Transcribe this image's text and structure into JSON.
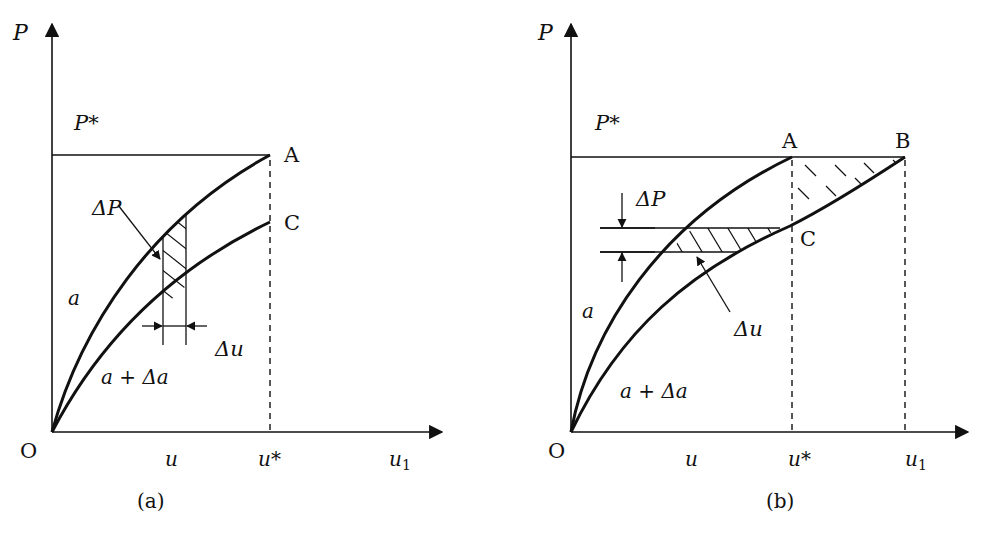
{
  "figure": {
    "panels": [
      {
        "id": "a",
        "caption": "(a)",
        "y_axis_label": "P",
        "x_axis_label": "u1",
        "origin_label": "O",
        "load_level_label": "P*",
        "point_labels": {
          "A": "A",
          "C": "C"
        },
        "curve_labels": {
          "upper": "a",
          "lower": "a + Δa"
        },
        "increment_labels": {
          "dP": "ΔP",
          "du": "Δu"
        },
        "x_ticks": {
          "u": "u",
          "u_star": "u*",
          "u1": "u"
        },
        "subscript": "1",
        "description": "Load-displacement curves for crack length a and a+Δa; hatched strip between curves at displacement u with width Δu; fixed-displacement end point u*"
      },
      {
        "id": "b",
        "caption": "(b)",
        "y_axis_label": "P",
        "x_axis_label": "u1",
        "origin_label": "O",
        "load_level_label": "P*",
        "point_labels": {
          "A": "A",
          "B": "B",
          "C": "C"
        },
        "curve_labels": {
          "upper": "a",
          "lower": "a + Δa"
        },
        "increment_labels": {
          "dP": "ΔP",
          "du": "Δu"
        },
        "x_ticks": {
          "u": "u",
          "u_star": "u*",
          "u1": "u"
        },
        "subscript": "1",
        "description": "Load-displacement curves for crack length a and a+Δa; horizontal hatched strip of height ΔP between curves; hatched triangle A-B-C under constant load P*"
      }
    ]
  }
}
